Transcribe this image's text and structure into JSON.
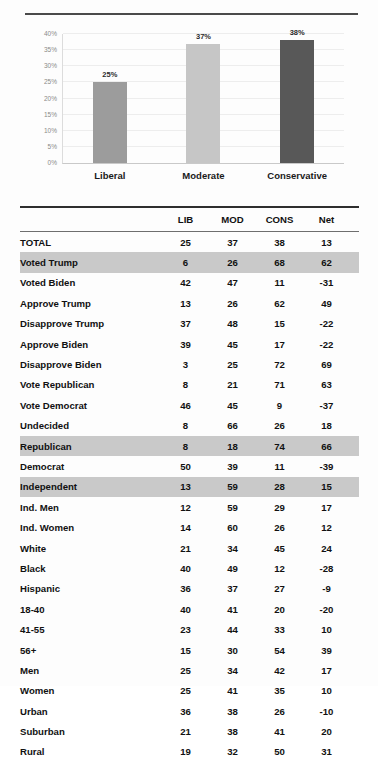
{
  "chart_data": {
    "type": "bar",
    "title": "",
    "xlabel": "",
    "ylabel": "",
    "categories": [
      "Liberal",
      "Moderate",
      "Conservative"
    ],
    "values": [
      25,
      37,
      38
    ],
    "value_labels": [
      "25%",
      "37%",
      "38%"
    ],
    "colors": [
      "#9c9c9c",
      "#c6c6c6",
      "#585858"
    ],
    "ylim": [
      0,
      40
    ],
    "yticks": [
      0,
      5,
      10,
      15,
      20,
      25,
      30,
      35,
      40
    ],
    "ytick_labels": [
      "0%",
      "5%",
      "10%",
      "15%",
      "20%",
      "25%",
      "30%",
      "35%",
      "40%"
    ],
    "grid": true,
    "legend": "none"
  },
  "table": {
    "columns": [
      "",
      "LIB",
      "MOD",
      "CONS",
      "Net"
    ],
    "rows": [
      {
        "label": "TOTAL",
        "lib": "25",
        "mod": "37",
        "cons": "38",
        "net": "13",
        "highlight": false
      },
      {
        "label": "Voted Trump",
        "lib": "6",
        "mod": "26",
        "cons": "68",
        "net": "62",
        "highlight": true
      },
      {
        "label": "Voted Biden",
        "lib": "42",
        "mod": "47",
        "cons": "11",
        "net": "-31",
        "highlight": false
      },
      {
        "label": "Approve Trump",
        "lib": "13",
        "mod": "26",
        "cons": "62",
        "net": "49",
        "highlight": false
      },
      {
        "label": "Disapprove Trump",
        "lib": "37",
        "mod": "48",
        "cons": "15",
        "net": "-22",
        "highlight": false
      },
      {
        "label": "Approve Biden",
        "lib": "39",
        "mod": "45",
        "cons": "17",
        "net": "-22",
        "highlight": false
      },
      {
        "label": "Disapprove Biden",
        "lib": "3",
        "mod": "25",
        "cons": "72",
        "net": "69",
        "highlight": false
      },
      {
        "label": "Vote Republican",
        "lib": "8",
        "mod": "21",
        "cons": "71",
        "net": "63",
        "highlight": false
      },
      {
        "label": "Vote Democrat",
        "lib": "46",
        "mod": "45",
        "cons": "9",
        "net": "-37",
        "highlight": false
      },
      {
        "label": "Undecided",
        "lib": "8",
        "mod": "66",
        "cons": "26",
        "net": "18",
        "highlight": false
      },
      {
        "label": "Republican",
        "lib": "8",
        "mod": "18",
        "cons": "74",
        "net": "66",
        "highlight": true
      },
      {
        "label": "Democrat",
        "lib": "50",
        "mod": "39",
        "cons": "11",
        "net": "-39",
        "highlight": false
      },
      {
        "label": "Independent",
        "lib": "13",
        "mod": "59",
        "cons": "28",
        "net": "15",
        "highlight": true
      },
      {
        "label": "Ind. Men",
        "lib": "12",
        "mod": "59",
        "cons": "29",
        "net": "17",
        "highlight": false
      },
      {
        "label": "Ind. Women",
        "lib": "14",
        "mod": "60",
        "cons": "26",
        "net": "12",
        "highlight": false
      },
      {
        "label": "White",
        "lib": "21",
        "mod": "34",
        "cons": "45",
        "net": "24",
        "highlight": false
      },
      {
        "label": "Black",
        "lib": "40",
        "mod": "49",
        "cons": "12",
        "net": "-28",
        "highlight": false
      },
      {
        "label": "Hispanic",
        "lib": "36",
        "mod": "37",
        "cons": "27",
        "net": "-9",
        "highlight": false
      },
      {
        "label": "18-40",
        "lib": "40",
        "mod": "41",
        "cons": "20",
        "net": "-20",
        "highlight": false
      },
      {
        "label": "41-55",
        "lib": "23",
        "mod": "44",
        "cons": "33",
        "net": "10",
        "highlight": false
      },
      {
        "label": "56+",
        "lib": "15",
        "mod": "30",
        "cons": "54",
        "net": "39",
        "highlight": false
      },
      {
        "label": "Men",
        "lib": "25",
        "mod": "34",
        "cons": "42",
        "net": "17",
        "highlight": false
      },
      {
        "label": "Women",
        "lib": "25",
        "mod": "41",
        "cons": "35",
        "net": "10",
        "highlight": false
      },
      {
        "label": "Urban",
        "lib": "36",
        "mod": "38",
        "cons": "26",
        "net": "-10",
        "highlight": false
      },
      {
        "label": "Suburban",
        "lib": "21",
        "mod": "38",
        "cons": "41",
        "net": "20",
        "highlight": false
      },
      {
        "label": "Rural",
        "lib": "19",
        "mod": "32",
        "cons": "50",
        "net": "31",
        "highlight": false
      }
    ]
  }
}
